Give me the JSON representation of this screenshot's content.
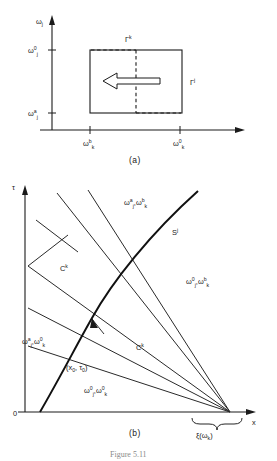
{
  "figure": {
    "number": "Figure 5.11",
    "panels": [
      {
        "id": "a",
        "caption": "(a)"
      },
      {
        "id": "b",
        "caption": "(b)"
      }
    ]
  },
  "panel_a": {
    "y_axis_label": "ω",
    "y_axis_label_sub": "j",
    "x_axis_label": "",
    "y_ticks": [
      {
        "base": "ω",
        "sub": "j",
        "sup": "0"
      },
      {
        "base": "ω",
        "sub": "j",
        "sup": "a"
      }
    ],
    "x_ticks": [
      {
        "base": "ω",
        "sub": "k",
        "sup": "b"
      },
      {
        "base": "ω",
        "sub": "k",
        "sup": "0"
      }
    ],
    "region_labels": [
      {
        "name": "gamma-k",
        "base": "Γ",
        "sup": "k"
      },
      {
        "name": "gamma-j",
        "base": "Γ",
        "sup": "j"
      }
    ],
    "arrow_direction": "left"
  },
  "panel_b": {
    "y_axis_label": "τ",
    "x_axis_label": "x",
    "origin_label": "0",
    "region_labels": [
      {
        "name": "region-upper",
        "parts": [
          {
            "base": "ω",
            "sub": "j",
            "sup": "a"
          },
          {
            "sep": ","
          },
          {
            "base": "ω",
            "sub": "k",
            "sup": "b"
          }
        ]
      },
      {
        "name": "region-right",
        "parts": [
          {
            "base": "ω",
            "sub": "j",
            "sup": "0"
          },
          {
            "sep": ","
          },
          {
            "base": "ω",
            "sub": "k",
            "sup": "b"
          }
        ]
      },
      {
        "name": "region-left",
        "parts": [
          {
            "base": "ω",
            "sub": "j",
            "sup": "a"
          },
          {
            "sep": ","
          },
          {
            "base": "ω",
            "sub": "k",
            "sup": "0"
          }
        ]
      },
      {
        "name": "region-lower",
        "parts": [
          {
            "base": "ω",
            "sub": "j",
            "sup": "0"
          },
          {
            "sep": ","
          },
          {
            "base": "ω",
            "sub": "k",
            "sup": "0"
          }
        ]
      }
    ],
    "curve_labels": [
      {
        "name": "shock-sj",
        "base": "S",
        "sup": "j"
      },
      {
        "name": "characteristic-ck-upper",
        "base": "C",
        "sup": "k"
      },
      {
        "name": "characteristic-ck-lower",
        "base": "C",
        "sup": "k"
      }
    ],
    "point_label": {
      "name": "point-x0-tau0",
      "open": "(x",
      "sub1": "0",
      "sep": ", τ",
      "sub2": "0",
      "close": ")"
    },
    "brace_label": {
      "name": "xi-omega-k",
      "base": "ξ(ω",
      "sub": "k",
      "close": ")"
    }
  },
  "colors": {
    "ink": "#1a1a1a",
    "paper": "#ffffff",
    "muted": "#8a8a8a"
  }
}
